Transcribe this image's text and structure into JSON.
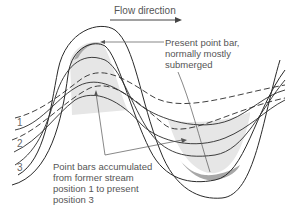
{
  "diagram": {
    "flow_label": "Flow direction",
    "present_bar_label": [
      "Present point bar,",
      "normally mostly",
      "submerged"
    ],
    "accumulated_label": [
      "Point bars accumulated",
      "from former stream",
      "position 1 to present",
      "position 3"
    ],
    "positions": [
      "1",
      "2",
      "3"
    ],
    "colors": {
      "line": "#2a2a2a",
      "point_bar_fill": "#e6e6e6",
      "present_bar_fill": "#a8a8a8",
      "text": "#555555"
    }
  }
}
